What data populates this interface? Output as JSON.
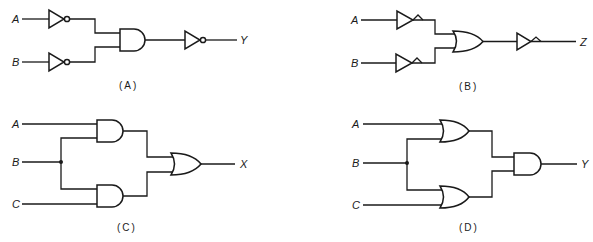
{
  "figure": {
    "panels": [
      {
        "id": "A",
        "caption": "(A)",
        "inputs": [
          "A",
          "B"
        ],
        "output": "Y",
        "gates": [
          "NOT (bubble) on A",
          "NOT (bubble) on B",
          "AND",
          "NOT (bubble) on output"
        ]
      },
      {
        "id": "B",
        "caption": "(B)",
        "inputs": [
          "A",
          "B"
        ],
        "output": "Z",
        "gates": [
          "NOT (polarity indicator) on A",
          "NOT (polarity indicator) on B",
          "OR",
          "NOT (polarity indicator) on output"
        ]
      },
      {
        "id": "C",
        "caption": "(C)",
        "inputs": [
          "A",
          "B",
          "C"
        ],
        "output": "X",
        "gates": [
          "AND (A, B)",
          "AND (B, C)",
          "OR"
        ]
      },
      {
        "id": "D",
        "caption": "(D)",
        "inputs": [
          "A",
          "B",
          "C"
        ],
        "output": "Y",
        "gates": [
          "OR (A, B)",
          "OR (B, C)",
          "AND"
        ]
      }
    ]
  },
  "labels": {
    "a": {
      "in_a": "A",
      "in_b": "B",
      "out": "Y",
      "caption": "(A)"
    },
    "b": {
      "in_a": "A",
      "in_b": "B",
      "out": "Z",
      "caption": "(B)"
    },
    "c": {
      "in_a": "A",
      "in_b": "B",
      "in_c": "C",
      "out": "X",
      "caption": "(C)"
    },
    "d": {
      "in_a": "A",
      "in_b": "B",
      "in_c": "C",
      "out": "Y",
      "caption": "(D)"
    }
  },
  "colors": {
    "ink": "#1a1a1a",
    "background": "#ffffff"
  }
}
